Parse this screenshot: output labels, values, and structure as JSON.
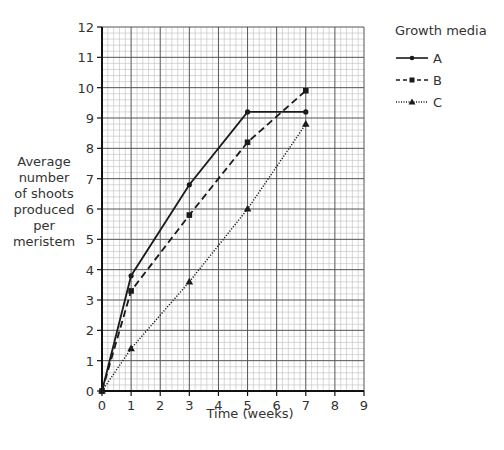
{
  "chart_data": {
    "type": "line",
    "title": "",
    "xlabel": "Time (weeks)",
    "ylabel": "Average number of shoots produced per meristem",
    "xlim": [
      0,
      9
    ],
    "ylim": [
      0,
      12
    ],
    "x_ticks": [
      0,
      1,
      2,
      3,
      4,
      5,
      6,
      7,
      8,
      9
    ],
    "y_ticks": [
      0,
      1,
      2,
      3,
      4,
      5,
      6,
      7,
      8,
      9,
      10,
      11,
      12
    ],
    "grid": true,
    "legend_title": "Growth media",
    "legend_position": "right",
    "x": [
      0,
      1,
      3,
      5,
      7
    ],
    "series": [
      {
        "name": "A",
        "style": "solid",
        "marker": "circle",
        "values": [
          0,
          3.8,
          6.8,
          9.2,
          9.2
        ]
      },
      {
        "name": "B",
        "style": "dashed",
        "marker": "square",
        "values": [
          0,
          3.3,
          5.8,
          8.2,
          9.9
        ]
      },
      {
        "name": "C",
        "style": "dotted",
        "marker": "triangle",
        "values": [
          0,
          1.4,
          3.6,
          6.0,
          8.8
        ]
      }
    ]
  },
  "labels": {
    "ylabel_lines": [
      "Average",
      "number",
      "of shoots",
      "produced",
      "per",
      "meristem"
    ],
    "xlabel": "Time (weeks)",
    "legend_title": "Growth media",
    "legend": [
      "A",
      "B",
      "C"
    ]
  },
  "colors": {
    "line": "#1a1a1a",
    "grid_minor": "#bdbdbd",
    "grid_major": "#555555",
    "axis": "#111111"
  }
}
